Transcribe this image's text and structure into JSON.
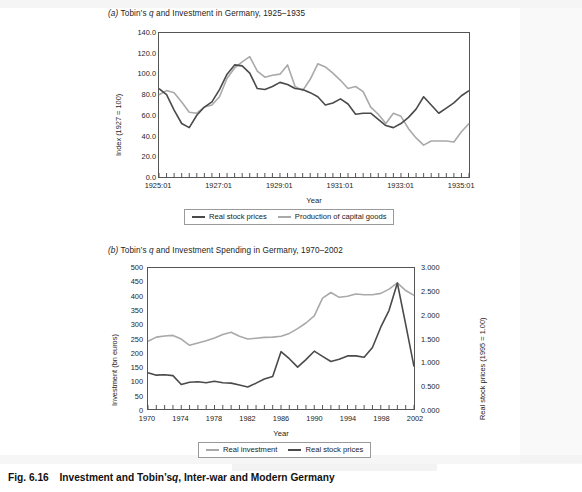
{
  "figure": {
    "caption_prefix": "Fig. 6.16",
    "caption_text_a": "Investment and Tobin’s",
    "caption_italic": "q",
    "caption_text_b": ", Inter-war and Modern Germany"
  },
  "colors": {
    "dark_line": "#4a4a4a",
    "light_line": "#a9a9a9",
    "axis": "#555555",
    "text": "#1d1d1d"
  },
  "panel_a": {
    "label": "(a)",
    "title_before": "Tobin’s",
    "title_italic": "q",
    "title_after": "and Investment in Germany, 1925–1935",
    "legend": [
      {
        "name": "Real stock prices",
        "color": "#4a4a4a"
      },
      {
        "name": "Production of capital goods",
        "color": "#a9a9a9"
      }
    ],
    "chart_data": {
      "type": "line",
      "title": "(a) Tobin’s q and Investment in Germany, 1925–1935",
      "xlabel": "Year",
      "ylabel": "Index (1927 = 100)",
      "ylim": [
        0.0,
        140.0
      ],
      "yticks": [
        "0.0",
        "20.0",
        "40.0",
        "60.0",
        "80.0",
        "100.0",
        "120.0",
        "140.0"
      ],
      "ytick_values": [
        0,
        20,
        40,
        60,
        80,
        100,
        120,
        140
      ],
      "xticks": [
        "1925:01",
        "1927:01",
        "1929:01",
        "1931:01",
        "1933:01",
        "1935:01"
      ],
      "xtick_values": [
        1925.0,
        1927.0,
        1929.0,
        1931.0,
        1933.0,
        1935.0
      ],
      "xlim": [
        1925.0,
        1935.25
      ],
      "minor_tick_interval_years": 0.25,
      "grid": false,
      "legend_position": "below",
      "x": [
        1925.0,
        1925.25,
        1925.5,
        1925.75,
        1926.0,
        1926.25,
        1926.5,
        1926.75,
        1927.0,
        1927.25,
        1927.5,
        1927.75,
        1928.0,
        1928.25,
        1928.5,
        1928.75,
        1929.0,
        1929.25,
        1929.5,
        1929.75,
        1930.0,
        1930.25,
        1930.5,
        1930.75,
        1931.0,
        1931.25,
        1931.5,
        1931.75,
        1932.0,
        1932.25,
        1932.5,
        1932.75,
        1933.0,
        1933.25,
        1933.5,
        1933.75,
        1934.0,
        1934.25,
        1934.5,
        1934.75,
        1935.0,
        1935.25
      ],
      "series": [
        {
          "name": "Real stock prices",
          "color": "#4a4a4a",
          "values": [
            86,
            80,
            65,
            52,
            48,
            60,
            68,
            73,
            85,
            100,
            109,
            108,
            101,
            86,
            85,
            88,
            92,
            90,
            86,
            85,
            82,
            78,
            70,
            72,
            76,
            71,
            61,
            62,
            62,
            56,
            50,
            48,
            52,
            58,
            66,
            78,
            70,
            62,
            67,
            72,
            79,
            84
          ]
        },
        {
          "name": "Production of capital goods",
          "color": "#a9a9a9",
          "values": [
            80,
            84,
            82,
            73,
            63,
            62,
            68,
            70,
            78,
            96,
            106,
            112,
            117,
            103,
            97,
            99,
            100,
            109,
            88,
            84,
            95,
            110,
            107,
            101,
            94,
            86,
            88,
            83,
            68,
            61,
            52,
            62,
            59,
            47,
            38,
            31,
            35,
            35,
            35,
            34,
            44,
            52
          ]
        }
      ],
      "note": "Production of capital goods series is drawn as plotted; values read off the 0–140 index axis."
    }
  },
  "panel_b": {
    "label": "(b)",
    "title_before": "Tobin’s",
    "title_italic": "q",
    "title_after": "and Investment Spending in Germany, 1970–2002",
    "legend": [
      {
        "name": "Real investment",
        "color": "#a9a9a9"
      },
      {
        "name": "Real stock prices",
        "color": "#4a4a4a"
      }
    ],
    "chart_data": {
      "type": "line",
      "title": "(b) Tobin’s q and Investment Spending in Germany, 1970–2002",
      "xlabel": "Year",
      "ylabel_left": "Investment (bn euros)",
      "ylabel_right": "Real stock prices (1995 = 1.00)",
      "ylim_left": [
        0,
        500
      ],
      "yticks_left": [
        "0",
        "50",
        "100",
        "150",
        "200",
        "250",
        "300",
        "350",
        "400",
        "450",
        "500"
      ],
      "ytick_values_left": [
        0,
        50,
        100,
        150,
        200,
        250,
        300,
        350,
        400,
        450,
        500
      ],
      "ylim_right": [
        0.0,
        3.0
      ],
      "yticks_right": [
        "0.000",
        "0.500",
        "1.000",
        "1.500",
        "2.000",
        "2.500",
        "3.000"
      ],
      "ytick_values_right": [
        0.0,
        0.5,
        1.0,
        1.5,
        2.0,
        2.5,
        3.0
      ],
      "xticks": [
        "1970",
        "1974",
        "1978",
        "1982",
        "1986",
        "1990",
        "1994",
        "1998",
        "2002"
      ],
      "xtick_values": [
        1970,
        1974,
        1978,
        1982,
        1986,
        1990,
        1994,
        1998,
        2002
      ],
      "xlim": [
        1970,
        2002
      ],
      "minor_tick_interval_years": 1,
      "grid": false,
      "legend_position": "below",
      "x": [
        1970,
        1971,
        1972,
        1973,
        1974,
        1975,
        1976,
        1977,
        1978,
        1979,
        1980,
        1981,
        1982,
        1983,
        1984,
        1985,
        1986,
        1987,
        1988,
        1989,
        1990,
        1991,
        1992,
        1993,
        1994,
        1995,
        1996,
        1997,
        1998,
        1999,
        2000,
        2001,
        2002
      ],
      "series": [
        {
          "name": "Real investment",
          "axis": "left",
          "unit": "bn euros",
          "color": "#a9a9a9",
          "values": [
            240,
            255,
            259,
            261,
            248,
            226,
            234,
            242,
            252,
            264,
            272,
            258,
            248,
            251,
            254,
            255,
            258,
            268,
            285,
            305,
            330,
            393,
            413,
            396,
            400,
            408,
            405,
            405,
            410,
            425,
            447,
            420,
            403
          ]
        },
        {
          "name": "Real stock prices",
          "axis": "right",
          "unit": "index (1995 = 1.00)",
          "color": "#4a4a4a",
          "values_left_scale": [
            129,
            120,
            121,
            119,
            86,
            95,
            96,
            93,
            98,
            93,
            91,
            85,
            79,
            92,
            106,
            115,
            204,
            178,
            148,
            175,
            205,
            186,
            168,
            176,
            189,
            188,
            183,
            218,
            290,
            350,
            447,
            300,
            150
          ],
          "values": [
            0.77,
            0.72,
            0.73,
            0.71,
            0.52,
            0.57,
            0.58,
            0.56,
            0.59,
            0.56,
            0.55,
            0.51,
            0.47,
            0.55,
            0.64,
            0.69,
            1.22,
            1.07,
            0.89,
            1.05,
            1.23,
            1.12,
            1.01,
            1.06,
            1.13,
            1.13,
            1.1,
            1.31,
            1.74,
            2.1,
            2.68,
            1.8,
            0.9
          ]
        }
      ]
    }
  }
}
